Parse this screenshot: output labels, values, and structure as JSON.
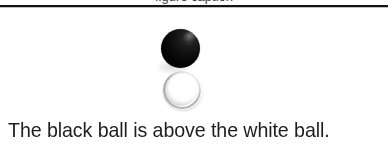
{
  "page": {
    "background_color": "#ffffff",
    "width": 388,
    "height": 148
  },
  "top_fragment": {
    "clipped_text": "figure caption"
  },
  "divider": {
    "color": "#141414"
  },
  "figure": {
    "name": "two-stacked-balls-illustration",
    "objects": [
      {
        "label": "black ball",
        "shape": "circle",
        "fill": "#000000",
        "rendering": "filled",
        "diameter_px": 39,
        "center_x": 180,
        "center_y": 48,
        "position": "top",
        "highlight": "upper-right specular",
        "shadow": "faint, lower-left"
      },
      {
        "label": "white ball",
        "shape": "circle",
        "fill": "#ffffff",
        "outline_color": "#969696",
        "rendering": "outline ring, open toward upper-right",
        "diameter_px": 34,
        "center_x": 181,
        "center_y": 88,
        "position": "bottom",
        "highlight": "upper-right (light source)",
        "shadow": "lower-left inner shading"
      }
    ],
    "relation": "black ball above white ball"
  },
  "caption": {
    "text": "The black ball is above the white ball.",
    "color": "#1e1e1e",
    "align": "left"
  }
}
